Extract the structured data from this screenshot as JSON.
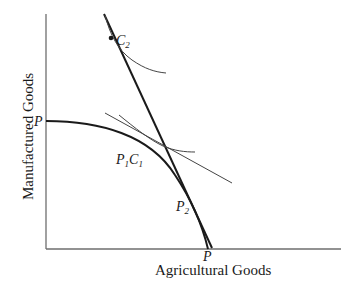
{
  "diagram": {
    "axes": {
      "x_label": "Agricultural Goods",
      "y_label": "Manufactured Goods"
    },
    "points": {
      "p_y_intercept": "P",
      "p_x_intercept": "P",
      "c2": {
        "main": "C",
        "sub": "2"
      },
      "p1c1": {
        "p": "P",
        "p_sub": "1",
        "c": "C",
        "c_sub": "1"
      },
      "p2": {
        "main": "P",
        "sub": "2"
      }
    },
    "colors": {
      "line": "#1a1a1a",
      "axis": "#6e6e6e",
      "thin": "#444444"
    }
  }
}
